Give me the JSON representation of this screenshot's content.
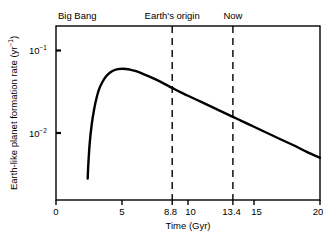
{
  "chart_data": {
    "type": "line",
    "title": "",
    "subtitle": "",
    "xlabel": "Time (Gyr)",
    "ylabel": "Earth-like planet formation rate (yr⁻¹)",
    "ylabel_base": "Earth-like planet formation rate (yr",
    "ylabel_sup": "−1",
    "ylabel_tail": ")",
    "xlim": [
      0,
      20
    ],
    "ylim": [
      0.0028,
      0.2
    ],
    "yscale": "log",
    "xscale": "linear",
    "grid": false,
    "legend": null,
    "xticks": [
      {
        "value": 0,
        "label": "0"
      },
      {
        "value": 5,
        "label": "5"
      },
      {
        "value": 8.8,
        "label": "8.8"
      },
      {
        "value": 10,
        "label": "10"
      },
      {
        "value": 13.4,
        "label": "13.4"
      },
      {
        "value": 15,
        "label": "15"
      },
      {
        "value": 20,
        "label": "20"
      }
    ],
    "yticks": [
      {
        "value": 0.1,
        "base": "10",
        "exponent": "−1",
        "label": "10⁻¹"
      },
      {
        "value": 0.01,
        "base": "10",
        "exponent": "−2",
        "label": "10⁻²"
      }
    ],
    "annotations": [
      {
        "name": "big-bang",
        "label": "Big Bang",
        "x": 2.4,
        "line": "solid-curve-start",
        "label_x": 4.0
      },
      {
        "name": "earths-origin",
        "label": "Earth's origin",
        "x": 8.8,
        "line": "dashed",
        "label_x": 8.8
      },
      {
        "name": "now",
        "label": "Now",
        "x": 13.4,
        "line": "dashed",
        "label_x": 13.4
      }
    ],
    "series": [
      {
        "name": "Earth-like planet formation rate",
        "color": "#000000",
        "x": [
          2.4,
          2.45,
          2.55,
          2.7,
          2.9,
          3.1,
          3.3,
          3.55,
          3.8,
          4.1,
          4.4,
          4.7,
          5.0,
          5.3,
          5.6,
          6.0,
          6.5,
          7.0,
          7.5,
          8.0,
          8.8,
          9.5,
          10.0,
          11.0,
          12.0,
          13.0,
          13.4,
          14.0,
          15.0,
          16.0,
          17.0,
          18.0,
          19.0,
          20.0
        ],
        "y": [
          0.0028,
          0.0042,
          0.0074,
          0.0125,
          0.0198,
          0.0277,
          0.0352,
          0.0424,
          0.0487,
          0.054,
          0.0576,
          0.0594,
          0.06,
          0.0596,
          0.0586,
          0.0565,
          0.0529,
          0.0489,
          0.0449,
          0.0411,
          0.0352,
          0.0308,
          0.0283,
          0.0238,
          0.02,
          0.0168,
          0.0157,
          0.0141,
          0.0119,
          0.01,
          0.0084,
          0.0071,
          0.0059,
          0.005
        ]
      }
    ],
    "key_readings": [
      {
        "label": "peak",
        "x": 5.0,
        "y": 0.06
      },
      {
        "label": "Earth's origin",
        "x": 8.8,
        "y": 0.035
      },
      {
        "label": "Now",
        "x": 13.4,
        "y": 0.0157
      },
      {
        "label": "end",
        "x": 20.0,
        "y": 0.005
      }
    ]
  }
}
